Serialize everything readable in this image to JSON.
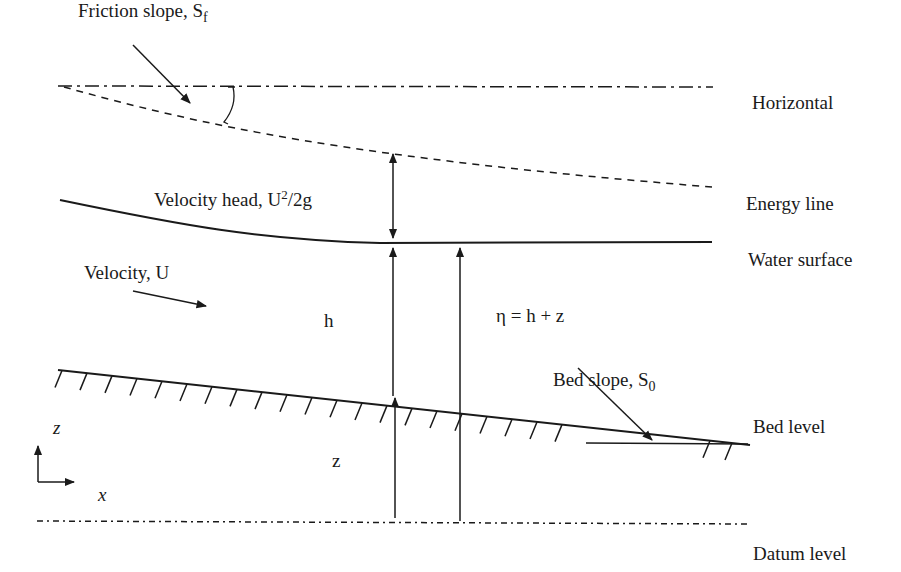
{
  "figure": {
    "labels": {
      "friction_slope": "Friction slope, S",
      "friction_slope_sub": "f",
      "horizontal": "Horizontal",
      "energy_line": "Energy line",
      "water_surface": "Water surface",
      "velocity_head_prefix": "Velocity head, U",
      "velocity_head_sup": "2",
      "velocity_head_suffix": "/2g",
      "velocity": "Velocity, U",
      "depth": "h",
      "stage": "η = h + z",
      "bed_slope": "Bed slope, S",
      "bed_slope_sub": "0",
      "bed_level": "Bed level",
      "elevation": "z",
      "datum_level": "Datum level",
      "axis_z": "z",
      "axis_x": "x"
    },
    "colors": {
      "ink": "#1a1a1a",
      "background": "#ffffff"
    }
  }
}
